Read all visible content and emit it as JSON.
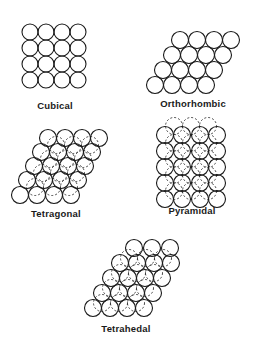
{
  "figure": {
    "panels": [
      {
        "id": "cubical",
        "label": "Cubical",
        "label_pos": [
          55,
          100
        ],
        "front": [
          [
            30,
            32
          ],
          [
            46,
            32
          ],
          [
            62,
            32
          ],
          [
            78,
            32
          ],
          [
            30,
            48
          ],
          [
            46,
            48
          ],
          [
            62,
            48
          ],
          [
            78,
            48
          ],
          [
            30,
            64
          ],
          [
            46,
            64
          ],
          [
            62,
            64
          ],
          [
            78,
            64
          ],
          [
            30,
            80
          ],
          [
            46,
            80
          ],
          [
            62,
            80
          ],
          [
            78,
            80
          ]
        ],
        "back": [],
        "r": 8
      },
      {
        "id": "orthorhombic",
        "label": "Orthorhombic",
        "label_pos": [
          193,
          98
        ],
        "front": [
          [
            180,
            40
          ],
          [
            197,
            40
          ],
          [
            214,
            40
          ],
          [
            231,
            40
          ],
          [
            172,
            55
          ],
          [
            189,
            55
          ],
          [
            206,
            55
          ],
          [
            223,
            55
          ],
          [
            163,
            70
          ],
          [
            180,
            70
          ],
          [
            197,
            70
          ],
          [
            214,
            70
          ],
          [
            155,
            85
          ],
          [
            172,
            85
          ],
          [
            189,
            85
          ],
          [
            206,
            85
          ]
        ],
        "back": [],
        "r": 8.5
      },
      {
        "id": "tetragonal",
        "label": "Tetragonal",
        "label_pos": [
          56,
          208
        ],
        "front": [
          [
            48,
            138
          ],
          [
            65,
            138
          ],
          [
            82,
            138
          ],
          [
            99,
            138
          ],
          [
            41,
            152
          ],
          [
            58,
            152
          ],
          [
            75,
            152
          ],
          [
            92,
            152
          ],
          [
            34,
            166
          ],
          [
            51,
            166
          ],
          [
            68,
            166
          ],
          [
            85,
            166
          ],
          [
            27,
            180
          ],
          [
            44,
            180
          ],
          [
            61,
            180
          ],
          [
            78,
            180
          ],
          [
            20,
            195
          ],
          [
            37,
            195
          ],
          [
            54,
            195
          ],
          [
            71,
            195
          ]
        ],
        "back": [
          [
            56,
            145
          ],
          [
            73,
            145
          ],
          [
            90,
            145
          ],
          [
            49,
            159
          ],
          [
            66,
            159
          ],
          [
            83,
            159
          ],
          [
            42,
            173
          ],
          [
            59,
            173
          ],
          [
            76,
            173
          ],
          [
            35,
            187
          ],
          [
            52,
            187
          ],
          [
            69,
            187
          ]
        ],
        "r": 8.5
      },
      {
        "id": "pyramidal",
        "label": "Pyramidal",
        "label_pos": [
          192,
          205
        ],
        "front": [
          [
            165,
            135
          ],
          [
            182,
            135
          ],
          [
            200,
            135
          ],
          [
            217,
            135
          ],
          [
            165,
            151
          ],
          [
            182,
            151
          ],
          [
            200,
            151
          ],
          [
            217,
            151
          ],
          [
            165,
            167
          ],
          [
            182,
            167
          ],
          [
            200,
            167
          ],
          [
            217,
            167
          ],
          [
            165,
            183
          ],
          [
            182,
            183
          ],
          [
            200,
            183
          ],
          [
            217,
            183
          ],
          [
            165,
            199
          ],
          [
            182,
            199
          ],
          [
            200,
            199
          ],
          [
            217,
            199
          ]
        ],
        "back": [
          [
            174,
            126
          ],
          [
            191,
            126
          ],
          [
            208,
            126
          ],
          [
            174,
            143
          ],
          [
            191,
            143
          ],
          [
            208,
            143
          ],
          [
            174,
            159
          ],
          [
            191,
            159
          ],
          [
            208,
            159
          ],
          [
            174,
            175
          ],
          [
            191,
            175
          ],
          [
            208,
            175
          ],
          [
            174,
            191
          ],
          [
            191,
            191
          ],
          [
            208,
            191
          ]
        ],
        "r": 8.5
      },
      {
        "id": "tetrahedal",
        "label": "Tetrahedal",
        "label_pos": [
          126,
          323
        ],
        "front": [
          [
            134,
            248
          ],
          [
            152,
            248
          ],
          [
            170,
            248
          ],
          [
            120,
            263
          ],
          [
            137,
            263
          ],
          [
            154,
            263
          ],
          [
            171,
            263
          ],
          [
            111,
            278
          ],
          [
            128,
            278
          ],
          [
            145,
            278
          ],
          [
            162,
            278
          ],
          [
            102,
            293
          ],
          [
            119,
            293
          ],
          [
            136,
            293
          ],
          [
            153,
            293
          ],
          [
            93,
            308
          ],
          [
            110,
            308
          ],
          [
            127,
            308
          ],
          [
            144,
            308
          ]
        ],
        "back": [
          [
            129,
            258
          ],
          [
            146,
            258
          ],
          [
            163,
            258
          ],
          [
            120,
            273
          ],
          [
            137,
            273
          ],
          [
            154,
            273
          ],
          [
            111,
            288
          ],
          [
            128,
            288
          ],
          [
            145,
            288
          ],
          [
            102,
            303
          ],
          [
            119,
            303
          ],
          [
            136,
            303
          ]
        ],
        "r": 8.5
      }
    ]
  }
}
